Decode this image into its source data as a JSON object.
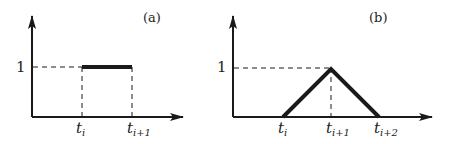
{
  "panels": [
    {
      "id": "a",
      "tag": "(a)",
      "y_label": "1",
      "shape": "step",
      "ticks": [
        {
          "base": "t",
          "sub": "i"
        },
        {
          "base": "t",
          "sub": "i+1"
        }
      ]
    },
    {
      "id": "b",
      "tag": "(b)",
      "y_label": "1",
      "shape": "hat",
      "ticks": [
        {
          "base": "t",
          "sub": "i"
        },
        {
          "base": "t",
          "sub": "i+1"
        },
        {
          "base": "t",
          "sub": "i+2"
        }
      ]
    }
  ],
  "colors": {
    "ink": "#1a1a1a",
    "background": "#ffffff"
  }
}
